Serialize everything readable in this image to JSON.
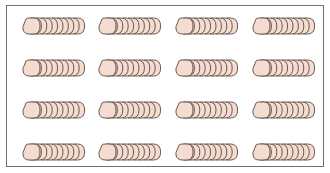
{
  "figure": {
    "rows": 4,
    "columns": 4,
    "coins_per_stack": 10,
    "total_stacks": 16,
    "coin_fill": "#f4dcd0",
    "coin_stroke": "#5a4a44",
    "frame_color": "#6f6f6f"
  },
  "stacks": [
    {
      "row": 1,
      "col": 1
    },
    {
      "row": 1,
      "col": 2
    },
    {
      "row": 1,
      "col": 3
    },
    {
      "row": 1,
      "col": 4
    },
    {
      "row": 2,
      "col": 1
    },
    {
      "row": 2,
      "col": 2
    },
    {
      "row": 2,
      "col": 3
    },
    {
      "row": 2,
      "col": 4
    },
    {
      "row": 3,
      "col": 1
    },
    {
      "row": 3,
      "col": 2
    },
    {
      "row": 3,
      "col": 3
    },
    {
      "row": 3,
      "col": 4
    },
    {
      "row": 4,
      "col": 1
    },
    {
      "row": 4,
      "col": 2
    },
    {
      "row": 4,
      "col": 3
    },
    {
      "row": 4,
      "col": 4
    }
  ]
}
